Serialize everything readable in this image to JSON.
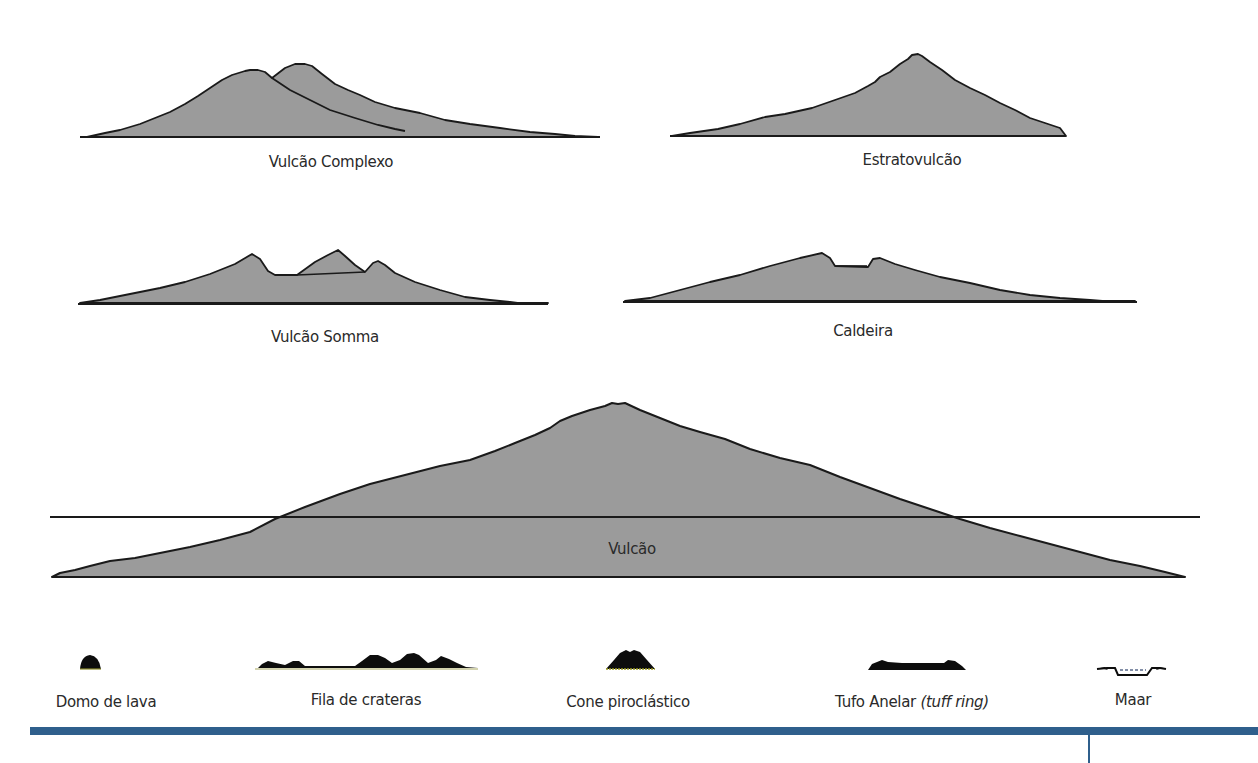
{
  "figure": {
    "fill_color": "#9a9a9a",
    "outline_color": "#1a1a1a",
    "icon_color": "#0d0d0d",
    "accent_bar_color": "#2f5f8c"
  },
  "profiles": [
    {
      "id": "complexo",
      "label": "Vulcão Complexo"
    },
    {
      "id": "estrato",
      "label": "Estratovulcão"
    },
    {
      "id": "somma",
      "label": "Vulcão Somma"
    },
    {
      "id": "caldeira",
      "label": "Caldeira"
    },
    {
      "id": "vulcao",
      "label": "Vulcão"
    }
  ],
  "small_forms": [
    {
      "id": "domo",
      "label": "Domo de lava"
    },
    {
      "id": "fila",
      "label": "Fila de crateras"
    },
    {
      "id": "cone",
      "label": "Cone piroclástico"
    },
    {
      "id": "tufo",
      "label": "Tufo Anelar",
      "label_italic": "(tuff ring)"
    },
    {
      "id": "maar",
      "label": "Maar"
    }
  ]
}
